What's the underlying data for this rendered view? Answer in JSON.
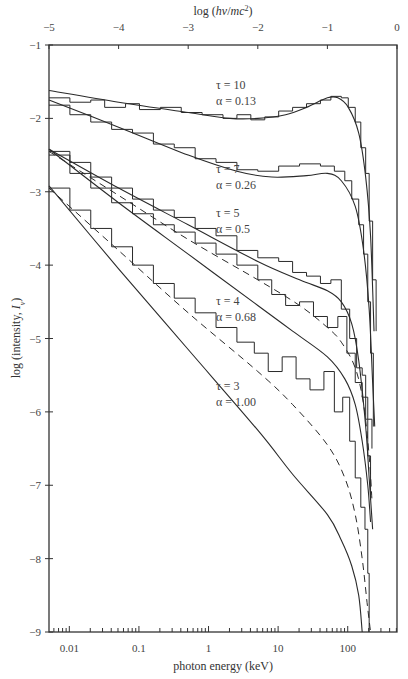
{
  "chart_data": {
    "type": "line",
    "title": "",
    "xlabel": "photon energy (keV)",
    "xlabel_top": "log (hν/mc²)",
    "ylabel": "log (intensity, Iν)",
    "xlim_top": [
      -5,
      0
    ],
    "ylim": [
      -9,
      -1
    ],
    "x_ticks_top": [
      "−5",
      "−4",
      "−3",
      "−2",
      "−1",
      "0"
    ],
    "x_ticks_top_values": [
      -5,
      -4,
      -3,
      -2,
      -1,
      0
    ],
    "x_ticks_bottom": [
      "0.01",
      "0.1",
      "1",
      "10",
      "100"
    ],
    "x_ticks_bottom_values_top_units": [
      -4.708,
      -3.708,
      -2.708,
      -1.708,
      -0.708
    ],
    "y_ticks": [
      "−1",
      "−2",
      "−3",
      "−4",
      "−5",
      "−6",
      "−7",
      "−8",
      "−9"
    ],
    "y_ticks_values": [
      -1,
      -2,
      -3,
      -4,
      -5,
      -6,
      -7,
      -8,
      -9
    ],
    "grid": false,
    "series": [
      {
        "name": "τ = 10, α = 0.13",
        "tau": "10",
        "alpha": "0.13",
        "label_pos": [
          -2.6,
          -1.6
        ],
        "model": [
          [
            -5,
            -1.62
          ],
          [
            -4,
            -1.78
          ],
          [
            -3,
            -1.92
          ],
          [
            -2.4,
            -2.0
          ],
          [
            -2,
            -2.0
          ],
          [
            -1.6,
            -1.95
          ],
          [
            -1.3,
            -1.85
          ],
          [
            -1.0,
            -1.72
          ],
          [
            -0.85,
            -1.72
          ],
          [
            -0.7,
            -1.85
          ],
          [
            -0.55,
            -2.2
          ],
          [
            -0.45,
            -2.8
          ],
          [
            -0.38,
            -3.6
          ],
          [
            -0.33,
            -4.9
          ]
        ],
        "histogram": [
          [
            -5,
            -1.72
          ],
          [
            -4.7,
            -1.78
          ],
          [
            -4.4,
            -1.75
          ],
          [
            -4.2,
            -1.85
          ],
          [
            -3.9,
            -1.8
          ],
          [
            -3.7,
            -1.88
          ],
          [
            -3.4,
            -1.85
          ],
          [
            -3.1,
            -1.92
          ],
          [
            -2.8,
            -1.95
          ],
          [
            -2.5,
            -2.0
          ],
          [
            -2.3,
            -1.95
          ],
          [
            -2.1,
            -2.02
          ],
          [
            -1.9,
            -1.98
          ],
          [
            -1.7,
            -1.9
          ],
          [
            -1.5,
            -1.85
          ],
          [
            -1.3,
            -1.8
          ],
          [
            -1.1,
            -1.75
          ],
          [
            -0.95,
            -1.7
          ],
          [
            -0.8,
            -1.72
          ],
          [
            -0.7,
            -1.85
          ],
          [
            -0.6,
            -2.05
          ],
          [
            -0.52,
            -2.4
          ],
          [
            -0.45,
            -2.75
          ],
          [
            -0.4,
            -3.4
          ],
          [
            -0.35,
            -4.2
          ],
          [
            -0.3,
            -4.9
          ]
        ]
      },
      {
        "name": "τ = 7, α = 0.26",
        "tau": "7",
        "alpha": "0.26",
        "label_pos": [
          -2.6,
          -2.75
        ],
        "model": [
          [
            -5,
            -1.75
          ],
          [
            -4,
            -2.12
          ],
          [
            -3,
            -2.5
          ],
          [
            -2.3,
            -2.72
          ],
          [
            -1.8,
            -2.8
          ],
          [
            -1.3,
            -2.78
          ],
          [
            -1.0,
            -2.75
          ],
          [
            -0.8,
            -2.85
          ],
          [
            -0.6,
            -3.2
          ],
          [
            -0.48,
            -3.8
          ],
          [
            -0.4,
            -4.6
          ],
          [
            -0.35,
            -5.6
          ],
          [
            -0.32,
            -6.2
          ]
        ],
        "histogram": [
          [
            -5,
            -1.82
          ],
          [
            -4.7,
            -1.95
          ],
          [
            -4.4,
            -2.05
          ],
          [
            -4.1,
            -2.15
          ],
          [
            -3.8,
            -2.2
          ],
          [
            -3.5,
            -2.35
          ],
          [
            -3.2,
            -2.4
          ],
          [
            -2.9,
            -2.55
          ],
          [
            -2.6,
            -2.6
          ],
          [
            -2.3,
            -2.7
          ],
          [
            -2.0,
            -2.72
          ],
          [
            -1.7,
            -2.65
          ],
          [
            -1.4,
            -2.62
          ],
          [
            -1.1,
            -2.65
          ],
          [
            -0.9,
            -2.72
          ],
          [
            -0.75,
            -2.85
          ],
          [
            -0.65,
            -3.1
          ],
          [
            -0.55,
            -3.45
          ],
          [
            -0.48,
            -3.85
          ],
          [
            -0.42,
            -4.5
          ],
          [
            -0.38,
            -5.2
          ],
          [
            -0.34,
            -6.2
          ]
        ]
      },
      {
        "name": "τ = 5, α = 0.5",
        "tau": "5",
        "alpha": "0.5",
        "label_pos": [
          -2.6,
          -3.35
        ],
        "model": [
          [
            -5,
            -2.42
          ],
          [
            -4,
            -2.95
          ],
          [
            -3,
            -3.45
          ],
          [
            -2,
            -3.95
          ],
          [
            -1.4,
            -4.2
          ],
          [
            -1.0,
            -4.35
          ],
          [
            -0.8,
            -4.5
          ],
          [
            -0.65,
            -4.8
          ],
          [
            -0.55,
            -5.3
          ],
          [
            -0.45,
            -6.2
          ],
          [
            -0.4,
            -6.9
          ],
          [
            -0.35,
            -7.6
          ]
        ],
        "histogram": [
          [
            -5,
            -2.45
          ],
          [
            -4.7,
            -2.6
          ],
          [
            -4.4,
            -2.8
          ],
          [
            -4.1,
            -2.95
          ],
          [
            -3.8,
            -3.1
          ],
          [
            -3.5,
            -3.25
          ],
          [
            -3.2,
            -3.35
          ],
          [
            -2.9,
            -3.5
          ],
          [
            -2.6,
            -3.6
          ],
          [
            -2.3,
            -3.8
          ],
          [
            -2.0,
            -3.9
          ],
          [
            -1.7,
            -3.95
          ],
          [
            -1.5,
            -4.1
          ],
          [
            -1.3,
            -4.15
          ],
          [
            -1.1,
            -4.25
          ],
          [
            -0.95,
            -4.2
          ],
          [
            -0.8,
            -4.6
          ],
          [
            -0.68,
            -5.0
          ],
          [
            -0.58,
            -5.4
          ],
          [
            -0.5,
            -5.5
          ],
          [
            -0.45,
            -6.1
          ],
          [
            -0.42,
            -6.6
          ],
          [
            -0.38,
            -7.2
          ]
        ]
      },
      {
        "name": "τ = 4, α = 0.68",
        "tau": "4",
        "alpha": "0.68",
        "label_pos": [
          -2.6,
          -4.55
        ],
        "model": [
          [
            -5,
            -2.42
          ],
          [
            -4,
            -3.15
          ],
          [
            -3,
            -3.85
          ],
          [
            -2,
            -4.55
          ],
          [
            -1.5,
            -4.9
          ],
          [
            -1.0,
            -5.25
          ],
          [
            -0.75,
            -5.55
          ],
          [
            -0.6,
            -5.9
          ],
          [
            -0.5,
            -6.4
          ],
          [
            -0.42,
            -7.0
          ],
          [
            -0.38,
            -7.5
          ]
        ],
        "model_dashed": [
          [
            -5,
            -2.45
          ],
          [
            -4,
            -3.05
          ],
          [
            -3,
            -3.65
          ],
          [
            -2,
            -4.2
          ],
          [
            -1.4,
            -4.55
          ],
          [
            -1.0,
            -4.85
          ],
          [
            -0.8,
            -5.05
          ],
          [
            -0.6,
            -5.4
          ],
          [
            -0.48,
            -5.9
          ],
          [
            -0.4,
            -6.6
          ],
          [
            -0.36,
            -7.2
          ]
        ],
        "histogram": [
          [
            -5,
            -2.5
          ],
          [
            -4.7,
            -2.75
          ],
          [
            -4.4,
            -2.95
          ],
          [
            -4.1,
            -3.15
          ],
          [
            -3.8,
            -3.3
          ],
          [
            -3.5,
            -3.45
          ],
          [
            -3.2,
            -3.55
          ],
          [
            -2.9,
            -3.7
          ],
          [
            -2.6,
            -3.85
          ],
          [
            -2.3,
            -4.0
          ],
          [
            -2.0,
            -4.2
          ],
          [
            -1.8,
            -4.4
          ],
          [
            -1.6,
            -4.55
          ],
          [
            -1.4,
            -4.5
          ],
          [
            -1.2,
            -4.7
          ],
          [
            -1.0,
            -4.85
          ],
          [
            -0.85,
            -4.7
          ],
          [
            -0.72,
            -5.2
          ],
          [
            -0.6,
            -5.6
          ],
          [
            -0.5,
            -5.8
          ],
          [
            -0.42,
            -6.1
          ],
          [
            -0.36,
            -6.5
          ]
        ]
      },
      {
        "name": "τ = 3, α = 1.00",
        "tau": "3",
        "alpha": "1.00",
        "label_pos": [
          -2.6,
          -5.7
        ],
        "model": [
          [
            -5,
            -2.92
          ],
          [
            -4,
            -4.05
          ],
          [
            -3,
            -5.15
          ],
          [
            -2,
            -6.25
          ],
          [
            -1.5,
            -6.85
          ],
          [
            -1.0,
            -7.4
          ],
          [
            -0.8,
            -7.75
          ],
          [
            -0.65,
            -8.1
          ],
          [
            -0.55,
            -8.5
          ],
          [
            -0.5,
            -9.0
          ]
        ],
        "model_dashed": [
          [
            -5,
            -2.95
          ],
          [
            -4,
            -3.8
          ],
          [
            -3,
            -4.65
          ],
          [
            -2,
            -5.45
          ],
          [
            -1.5,
            -5.9
          ],
          [
            -1.0,
            -6.45
          ],
          [
            -0.75,
            -6.9
          ],
          [
            -0.6,
            -7.4
          ],
          [
            -0.5,
            -8.0
          ],
          [
            -0.43,
            -8.6
          ],
          [
            -0.38,
            -9.0
          ]
        ],
        "histogram": [
          [
            -5,
            -2.95
          ],
          [
            -4.7,
            -3.25
          ],
          [
            -4.4,
            -3.5
          ],
          [
            -4.1,
            -3.75
          ],
          [
            -3.8,
            -4.0
          ],
          [
            -3.5,
            -4.25
          ],
          [
            -3.2,
            -4.45
          ],
          [
            -2.9,
            -4.65
          ],
          [
            -2.6,
            -4.85
          ],
          [
            -2.3,
            -5.05
          ],
          [
            -2.05,
            -5.2
          ],
          [
            -1.85,
            -5.45
          ],
          [
            -1.65,
            -5.25
          ],
          [
            -1.45,
            -5.55
          ],
          [
            -1.25,
            -5.7
          ],
          [
            -1.05,
            -5.45
          ],
          [
            -0.9,
            -6.0
          ],
          [
            -0.78,
            -5.8
          ],
          [
            -0.68,
            -6.4
          ],
          [
            -0.6,
            -6.9
          ],
          [
            -0.52,
            -7.3
          ],
          [
            -0.46,
            -7.6
          ],
          [
            -0.42,
            -8.2
          ],
          [
            -0.4,
            -9.0
          ]
        ]
      }
    ]
  },
  "colors": {
    "line": "#2a2a2a",
    "axis": "#333333",
    "text": "#444444",
    "background": "#ffffff"
  }
}
